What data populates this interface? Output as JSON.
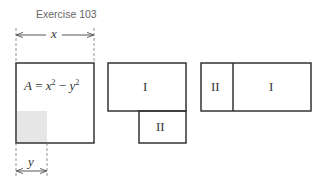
{
  "title": "Exercise 103",
  "figure1": {
    "x_label": "x",
    "y_label": "y",
    "area_var": "A",
    "equals": " = ",
    "term1_base": "x",
    "term1_exp": "2",
    "minus": " − ",
    "term2_base": "y",
    "term2_exp": "2",
    "shade_color": "#e6e6e6"
  },
  "figure2": {
    "region_top_label": "I",
    "region_bottom_label": "II"
  },
  "figure3": {
    "region_left_label": "II",
    "region_right_label": "I"
  }
}
